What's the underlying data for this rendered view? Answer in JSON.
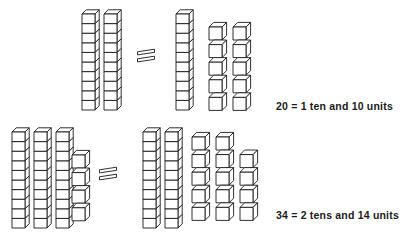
{
  "page": {
    "background_color": "#ffffff",
    "ink_color": "#1a1a1a",
    "width": 407,
    "height": 234
  },
  "style": {
    "cube_face": "#ffffff",
    "cube_stroke": "#1a1a1a",
    "stroke_width": 0.9
  },
  "rows": [
    {
      "id": "row-1",
      "caption": "20 = 1 ten and 10 units",
      "equation": {
        "total": 20,
        "tens": 1,
        "units": 10
      },
      "left_side": {
        "rods": 2,
        "loose_units": 0,
        "rod_length": 10,
        "value": 20
      },
      "operator": "=",
      "right_side": {
        "rods": 1,
        "loose_units": 10,
        "rod_length": 10,
        "value": 20,
        "unit_grid": [
          2,
          2,
          2,
          2,
          2
        ]
      }
    },
    {
      "id": "row-2",
      "caption": "34 = 2 tens and 14 units",
      "equation": {
        "total": 34,
        "tens": 2,
        "units": 14
      },
      "left_side": {
        "rods": 3,
        "loose_units": 4,
        "rod_length": 10,
        "value": 34
      },
      "operator": "=",
      "right_side": {
        "rods": 2,
        "loose_units": 14,
        "rod_length": 10,
        "value": 34,
        "unit_grid": [
          2,
          3,
          3,
          3,
          3
        ]
      }
    }
  ],
  "geometry": {
    "cube_w": 13,
    "cube_h": 9.6,
    "depth_x": 4.2,
    "depth_y": 4.2,
    "unit_w": 13,
    "unit_h": 13,
    "unit_depth": 4.6,
    "row1": {
      "rod_top": 14,
      "left_rods_x": [
        82,
        104
      ],
      "equals_x": 146,
      "equals_y": 54,
      "right_rods_x": [
        176
      ],
      "units_origin_x": 209,
      "units_origin_y": 27,
      "units_step_x": 24,
      "units_step_y": 17.6
    },
    "row2": {
      "rod_top": 132,
      "left_rods_x": [
        12,
        34,
        56
      ],
      "left_units_x": 72,
      "left_units_y": 155,
      "left_units_step_y": 17.6,
      "equals_x": 108,
      "equals_y": 172,
      "right_rods_x": [
        143,
        165
      ],
      "units_origin_x": 192,
      "units_origin_y": 137,
      "units_step_x": 24,
      "units_step_y": 17.6
    }
  }
}
